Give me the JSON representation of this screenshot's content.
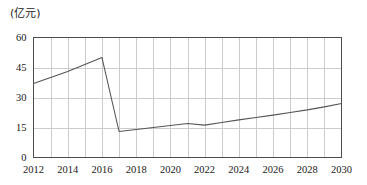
{
  "chart_data": {
    "type": "line",
    "title": "",
    "subtitle": "",
    "unit_label": "(亿元)",
    "xlabel": "",
    "ylabel": "",
    "ylim": [
      0,
      60
    ],
    "xlim": [
      2012,
      2030
    ],
    "yticks": [
      0,
      15,
      30,
      45,
      60
    ],
    "ytick_labels": [
      "0",
      "15",
      "30",
      "45",
      "60"
    ],
    "xticks": [
      2012,
      2014,
      2016,
      2018,
      2020,
      2022,
      2024,
      2026,
      2028,
      2030
    ],
    "xtick_labels": [
      "2012",
      "2014",
      "2016",
      "2018",
      "2020",
      "2022",
      "2024",
      "2026",
      "2028",
      "2030"
    ],
    "grid": true,
    "grid_x_step": 1,
    "grid_y_step": 15,
    "legend": false,
    "legend_position": "none",
    "x": [
      2012,
      2013,
      2014,
      2015,
      2016,
      2017,
      2018,
      2019,
      2020,
      2021,
      2022,
      2023,
      2024,
      2025,
      2026,
      2027,
      2028,
      2029,
      2030
    ],
    "values": [
      37,
      40,
      43,
      46.5,
      50,
      13,
      14,
      15,
      16,
      17,
      16.2,
      17.5,
      18.8,
      20,
      21.2,
      22.5,
      23.8,
      25.3,
      27
    ],
    "series": [
      {
        "name": "",
        "color": "#555555",
        "values": [
          37,
          40,
          43,
          46.5,
          50,
          13,
          14,
          15,
          16,
          17,
          16.2,
          17.5,
          18.8,
          20,
          21.2,
          22.5,
          23.8,
          25.3,
          27
        ]
      }
    ],
    "colors": {
      "line": "#555555",
      "grid": "#cccccc",
      "axis": "#4d4d4d",
      "text": "#1a1a1a",
      "background": "#ffffff"
    }
  }
}
